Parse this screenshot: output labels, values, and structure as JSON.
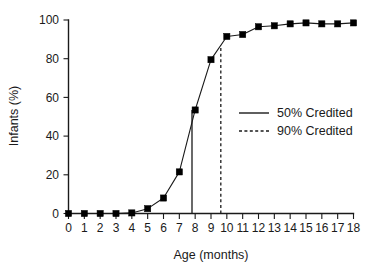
{
  "chart_data": {
    "type": "line",
    "title": "",
    "xlabel": "Age (months)",
    "ylabel": "Infants (%)",
    "xlim": [
      0,
      18
    ],
    "ylim": [
      0,
      100
    ],
    "grid": false,
    "legend_position": "center-right",
    "x_ticks": [
      "0",
      "1",
      "2",
      "3",
      "4",
      "5",
      "6",
      "7",
      "8",
      "9",
      "10",
      "11",
      "12",
      "13",
      "14",
      "15",
      "16",
      "17",
      "18"
    ],
    "y_ticks": [
      "0",
      "20",
      "40",
      "60",
      "80",
      "100"
    ],
    "x": [
      0,
      1,
      2,
      3,
      4,
      5,
      6,
      7,
      8,
      9,
      10,
      11,
      12,
      13,
      14,
      15,
      16,
      17,
      18
    ],
    "values": [
      0,
      0,
      0,
      0,
      0.3,
      2.5,
      8,
      21.5,
      53.5,
      79.5,
      91.5,
      92.5,
      96.5,
      97,
      98,
      98.5,
      98,
      98,
      98.5
    ],
    "series": [
      {
        "name": "Infants credited",
        "marker": "square",
        "values": [
          0,
          0,
          0,
          0,
          0.3,
          2.5,
          8,
          21.5,
          53.5,
          79.5,
          91.5,
          92.5,
          96.5,
          97,
          98,
          98.5,
          98,
          98,
          98.5
        ]
      }
    ],
    "reference_lines": [
      {
        "name": "50% Credited",
        "x": 7.8,
        "y_top": 53.5,
        "style": "solid"
      },
      {
        "name": "90% Credited",
        "x": 9.62,
        "y_top": 87,
        "style": "dashed"
      }
    ],
    "colors": {
      "line": "#1a1a1a",
      "marker": "#000000",
      "axis": "#1a1a1a",
      "background": "#ffffff"
    }
  },
  "legend": {
    "entries": [
      {
        "label": "50% Credited",
        "style": "solid"
      },
      {
        "label": "90% Credited",
        "style": "dashed"
      }
    ]
  }
}
